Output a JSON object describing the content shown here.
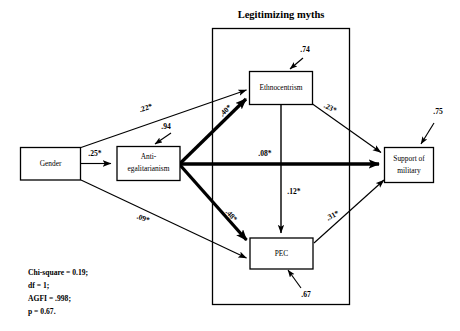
{
  "diagram": {
    "type": "path-diagram",
    "title_group": "Legitimizing myths",
    "nodes": [
      {
        "id": "gender",
        "label": "Gender",
        "label_line1": "Gender",
        "label_line2": ""
      },
      {
        "id": "antiegal",
        "label": "Anti-egalitarianism",
        "label_line1": "Anti-",
        "label_line2": "egalitarianism"
      },
      {
        "id": "ethno",
        "label": "Ethnocentrism",
        "label_line1": "Ethnocentrism",
        "label_line2": ""
      },
      {
        "id": "pec",
        "label": "PEC",
        "label_line1": "PEC",
        "label_line2": ""
      },
      {
        "id": "support",
        "label": "Support of military",
        "label_line1": "Support of",
        "label_line2": "military"
      }
    ],
    "paths": [
      {
        "id": "gender-antiegal",
        "from": "gender",
        "to": "antiegal",
        "coefficient": ".25*",
        "weight": "thin"
      },
      {
        "id": "gender-ethno",
        "from": "gender",
        "to": "ethno",
        "coefficient": ".22*",
        "weight": "thin"
      },
      {
        "id": "gender-pec",
        "from": "gender",
        "to": "pec",
        "coefficient": ".09*",
        "weight": "thin"
      },
      {
        "id": "antiegal-ethno",
        "from": "antiegal",
        "to": "ethno",
        "coefficient": ".40*",
        "weight": "thick"
      },
      {
        "id": "antiegal-support",
        "from": "antiegal",
        "to": "support",
        "coefficient": ".08*",
        "weight": "thick"
      },
      {
        "id": "antiegal-pec",
        "from": "antiegal",
        "to": "pec",
        "coefficient": ".48*",
        "weight": "thick"
      },
      {
        "id": "ethno-support",
        "from": "ethno",
        "to": "support",
        "coefficient": ".23*",
        "weight": "thin"
      },
      {
        "id": "ethno-pec",
        "from": "ethno",
        "to": "pec",
        "coefficient": ".12*",
        "weight": "thin"
      },
      {
        "id": "pec-support",
        "from": "pec",
        "to": "support",
        "coefficient": ".31*",
        "weight": "thin"
      }
    ],
    "disturbances": [
      {
        "id": "d-antiegal",
        "node": "antiegal",
        "value": ".94"
      },
      {
        "id": "d-ethno",
        "node": "ethno",
        "value": ".74"
      },
      {
        "id": "d-pec",
        "node": "pec",
        "value": ".67"
      },
      {
        "id": "d-support",
        "node": "support",
        "value": ".75"
      }
    ],
    "fit_statistics": [
      "Chi-square = 0.19;",
      "df = 1;",
      "AGFI = .998;",
      "p = 0.67."
    ],
    "colors": {
      "stroke": "#000000",
      "background": "#ffffff"
    }
  }
}
